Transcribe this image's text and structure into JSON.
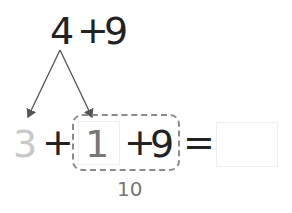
{
  "problem": {
    "top_expression": {
      "a": "4",
      "op": "+",
      "b": "9"
    },
    "decomposition": {
      "part1": "3",
      "part2": "1"
    },
    "row": {
      "first": "3",
      "plus1": "+",
      "box_value": "1",
      "plus2": "+",
      "nine": "9",
      "equals": "=",
      "answer": ""
    },
    "group_sum_label": "10"
  },
  "colors": {
    "text": "#222222",
    "faded_number": "#c8c8c8",
    "box_value": "#777777",
    "dashed_border": "#8a8a8a",
    "arrow": "#555555"
  }
}
